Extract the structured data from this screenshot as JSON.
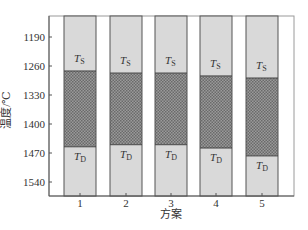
{
  "chart_data": {
    "type": "bar",
    "subtype": "floating-range",
    "title": "",
    "xlabel": "方案",
    "ylabel": "温度/℃",
    "y_inverted": true,
    "ylim": [
      1140,
      1580
    ],
    "yticks": [
      1190,
      1260,
      1330,
      1400,
      1470,
      1540
    ],
    "categories": [
      "1",
      "2",
      "3",
      "4",
      "5"
    ],
    "series": [
      {
        "name": "T_S",
        "label": "TS",
        "values": [
          1272,
          1277,
          1277,
          1284,
          1289
        ]
      },
      {
        "name": "T_D",
        "label": "TD",
        "values": [
          1455,
          1450,
          1450,
          1458,
          1477
        ]
      }
    ],
    "grid": false,
    "legend": "none",
    "annotations": [
      "T_S above each shaded band",
      "T_D below each shaded band"
    ]
  },
  "colors": {
    "light_fill": "#d9d9d9",
    "band_fill": "#8a8a8a",
    "border": "#555555",
    "axis": "#555555"
  },
  "labels": {
    "ts": "T",
    "ts_sub": "S",
    "td": "T",
    "td_sub": "D"
  }
}
